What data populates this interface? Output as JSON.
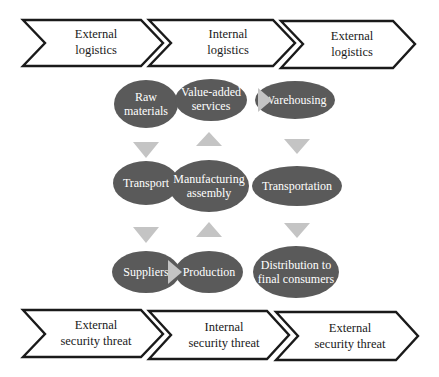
{
  "colors": {
    "node_fill": "#5a5a5a",
    "node_text": "#ffffff",
    "arrow_fill": "#c4c4c4",
    "chevron_stroke": "#1a1a1a"
  },
  "top_row": [
    {
      "line1": "External",
      "line2": "logistics"
    },
    {
      "line1": "Internal",
      "line2": "logistics"
    },
    {
      "line1": "External",
      "line2": "logistics"
    }
  ],
  "bottom_row": [
    {
      "line1": "External",
      "line2": "security threat"
    },
    {
      "line1": "Internal",
      "line2": "security threat"
    },
    {
      "line1": "External",
      "line2": "security threat"
    }
  ],
  "nodes": {
    "raw_materials": {
      "line1": "Raw",
      "line2": "materials"
    },
    "transport": {
      "line1": "Transport"
    },
    "suppliers": {
      "line1": "Suppliers"
    },
    "production": {
      "line1": "Production"
    },
    "manufacturing_assembly": {
      "line1": "Manufacturing",
      "line2": "assembly"
    },
    "value_added_services": {
      "line1": "Value-added",
      "line2": "services"
    },
    "warehousing": {
      "line1": "Warehousing"
    },
    "transportation": {
      "line1": "Transportation"
    },
    "distribution": {
      "line1": "Distribution to",
      "line2": "final consumers"
    }
  },
  "flow": [
    "Raw materials",
    "Transport",
    "Suppliers",
    "Production",
    "Manufacturing assembly",
    "Value-added services",
    "Warehousing",
    "Transportation",
    "Distribution to final consumers"
  ]
}
